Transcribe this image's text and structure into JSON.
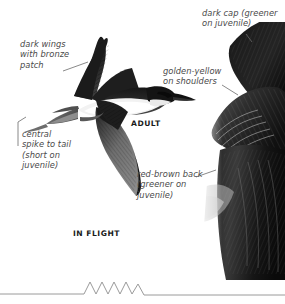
{
  "plate": {
    "background_color": "#ffffff",
    "ink_color": "#4a4a4a",
    "caption_color": "#1a1a1a"
  },
  "labels": [
    {
      "id": "dark-cap",
      "text": "dark cap (greener\non juvenile)",
      "lines": [
        "dark cap (greener",
        "on juvenile)"
      ],
      "style": "italic"
    },
    {
      "id": "dark-wings",
      "text": "dark wings\nwith bronze\npatch",
      "lines": [
        "dark wings",
        "with bronze",
        "patch"
      ],
      "style": "italic"
    },
    {
      "id": "golden-yellow",
      "text": "golden-yellow\non shoulders",
      "lines": [
        "golden-yellow",
        "on shoulders"
      ],
      "style": "italic"
    },
    {
      "id": "central-spike",
      "text": "central\nspike to tail\n(short on\njuvenile)",
      "lines": [
        "central",
        "spike to tail",
        "(short on",
        "juvenile)"
      ],
      "style": "italic"
    },
    {
      "id": "red-brown-back",
      "text": "red-brown back\n(greener on\njuvenile)",
      "lines": [
        "red-brown back",
        "(greener on",
        "juvenile)"
      ],
      "style": "italic"
    }
  ],
  "captions": [
    {
      "id": "adult",
      "text": "ADULT"
    },
    {
      "id": "in-flight",
      "text": "IN FLIGHT"
    }
  ],
  "figures": [
    {
      "id": "bird-in-flight",
      "name": "bird-in-flight-illustration",
      "description": "grayscale illustration of a bee-eater in flight, wings spread, long pointed bill to the right, pale belly band, long central tail spike"
    },
    {
      "id": "bird-perched",
      "name": "bird-perched-photo",
      "description": "dark photographic detail of perched bird plumage, cap and shoulder feathers"
    }
  ],
  "sonogram": {
    "id": "call-sonogram",
    "name": "call-waveform",
    "description": "flat line with a burst of five sharp zigzag peaks near the centre",
    "peak_count": 5
  }
}
